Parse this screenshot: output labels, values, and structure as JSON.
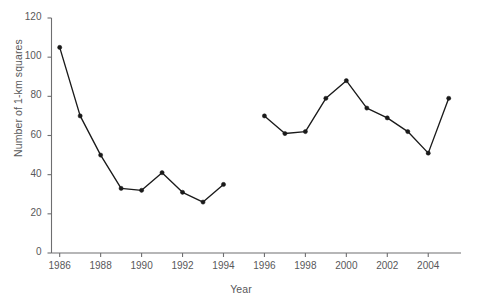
{
  "chart_data": {
    "type": "line",
    "title": "",
    "subtitle": "",
    "xlabel": "Year",
    "ylabel": "Number of 1-km squares",
    "xlim": [
      1985.6,
      2005.6
    ],
    "ylim": [
      0,
      120
    ],
    "grid": false,
    "legend": null,
    "x_ticks": [
      1986,
      1988,
      1990,
      1992,
      1994,
      1996,
      1998,
      2000,
      2002,
      2004
    ],
    "x_tick_labels": [
      "1986",
      "1988",
      "1990",
      "1992",
      "1994",
      "1996",
      "1998",
      "2000",
      "2002",
      "2004"
    ],
    "y_ticks": [
      0,
      20,
      40,
      60,
      80,
      100,
      120
    ],
    "y_tick_labels": [
      "0",
      "20",
      "40",
      "60",
      "80",
      "100",
      "120"
    ],
    "marker": "filled-circle",
    "marker_color": "#1a1a1a",
    "line_color": "#1a1a1a",
    "note": "data gap at 1995 (no observation); line drawn as two separate segments",
    "series": [
      {
        "name": "Number of 1-km squares",
        "x": [
          1986,
          1987,
          1988,
          1989,
          1990,
          1991,
          1992,
          1993,
          1994
        ],
        "values": [
          105,
          70,
          50,
          33,
          32,
          41,
          31,
          26,
          35
        ]
      },
      {
        "name": "Number of 1-km squares",
        "x": [
          1996,
          1997,
          1998,
          1999,
          2000,
          2001,
          2002,
          2003,
          2004,
          2005
        ],
        "values": [
          70,
          61,
          62,
          79,
          88,
          74,
          69,
          62,
          51,
          79
        ]
      }
    ]
  },
  "colors": {
    "axis": "#6e6e70",
    "text": "#58585a",
    "data": "#1a1a1a",
    "background": "#ffffff"
  }
}
